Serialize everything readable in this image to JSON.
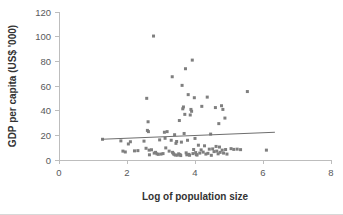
{
  "chart_data": {
    "type": "scatter",
    "title": "",
    "xlabel": "Log of population size",
    "ylabel": "GDP per capita (US$ '000)",
    "xlim": [
      0,
      8
    ],
    "ylim": [
      0,
      120
    ],
    "xticks": [
      0,
      2,
      4,
      6,
      8
    ],
    "yticks": [
      0,
      20,
      40,
      60,
      80,
      100,
      120
    ],
    "xtick_labels": [
      "0",
      "2",
      "4",
      "6",
      "8"
    ],
    "ytick_labels": [
      "0",
      "20",
      "40",
      "60",
      "80",
      "100",
      "120"
    ],
    "grid": false,
    "legend": null,
    "legend_position": "none",
    "series": [
      {
        "name": "Countries",
        "marker": "square",
        "color": "#7f7f7f",
        "points": [
          [
            1.28,
            16.8
          ],
          [
            1.82,
            15.5
          ],
          [
            1.88,
            7.2
          ],
          [
            1.95,
            6.5
          ],
          [
            2.04,
            13.0
          ],
          [
            2.1,
            14.8
          ],
          [
            2.22,
            7.4
          ],
          [
            2.32,
            7.6
          ],
          [
            2.5,
            15.3
          ],
          [
            2.56,
            9.5
          ],
          [
            2.58,
            50.0
          ],
          [
            2.6,
            24.0
          ],
          [
            2.62,
            31.0
          ],
          [
            2.63,
            23.0
          ],
          [
            2.65,
            8.0
          ],
          [
            2.66,
            4.2
          ],
          [
            2.72,
            8.3
          ],
          [
            2.78,
            100.5
          ],
          [
            2.8,
            5.6
          ],
          [
            2.84,
            6.2
          ],
          [
            2.88,
            5.0
          ],
          [
            2.92,
            4.6
          ],
          [
            2.96,
            16.3
          ],
          [
            3.0,
            4.8
          ],
          [
            3.06,
            5.2
          ],
          [
            3.1,
            22.5
          ],
          [
            3.12,
            17.6
          ],
          [
            3.14,
            9.8
          ],
          [
            3.18,
            23.0
          ],
          [
            3.24,
            7.2
          ],
          [
            3.3,
            16.0
          ],
          [
            3.33,
            67.5
          ],
          [
            3.34,
            6.2
          ],
          [
            3.36,
            5.4
          ],
          [
            3.38,
            4.6
          ],
          [
            3.4,
            20.5
          ],
          [
            3.42,
            4.0
          ],
          [
            3.44,
            13.5
          ],
          [
            3.46,
            15.0
          ],
          [
            3.48,
            3.9
          ],
          [
            3.52,
            5.0
          ],
          [
            3.54,
            32.0
          ],
          [
            3.56,
            4.4
          ],
          [
            3.58,
            3.6
          ],
          [
            3.6,
            14.5
          ],
          [
            3.62,
            60.5
          ],
          [
            3.64,
            41.5
          ],
          [
            3.66,
            43.0
          ],
          [
            3.68,
            21.5
          ],
          [
            3.7,
            37.0
          ],
          [
            3.72,
            74.0
          ],
          [
            3.74,
            5.8
          ],
          [
            3.76,
            4.2
          ],
          [
            3.78,
            16.0
          ],
          [
            3.8,
            53.0
          ],
          [
            3.82,
            4.6
          ],
          [
            3.84,
            3.8
          ],
          [
            3.86,
            36.5
          ],
          [
            3.88,
            41.0
          ],
          [
            3.9,
            39.5
          ],
          [
            3.92,
            81.0
          ],
          [
            3.94,
            5.2
          ],
          [
            3.96,
            8.5
          ],
          [
            3.98,
            50.5
          ],
          [
            4.0,
            17.5
          ],
          [
            4.02,
            6.0
          ],
          [
            4.04,
            4.4
          ],
          [
            4.06,
            4.0
          ],
          [
            4.1,
            12.0
          ],
          [
            4.14,
            5.6
          ],
          [
            4.18,
            8.2
          ],
          [
            4.2,
            43.5
          ],
          [
            4.24,
            6.4
          ],
          [
            4.28,
            11.5
          ],
          [
            4.32,
            4.8
          ],
          [
            4.36,
            51.0
          ],
          [
            4.38,
            5.4
          ],
          [
            4.42,
            8.8
          ],
          [
            4.46,
            21.0
          ],
          [
            4.48,
            3.8
          ],
          [
            4.52,
            9.0
          ],
          [
            4.56,
            6.8
          ],
          [
            4.6,
            42.5
          ],
          [
            4.62,
            11.0
          ],
          [
            4.64,
            7.2
          ],
          [
            4.68,
            5.0
          ],
          [
            4.7,
            29.5
          ],
          [
            4.72,
            10.5
          ],
          [
            4.74,
            6.2
          ],
          [
            4.78,
            44.0
          ],
          [
            4.8,
            8.0
          ],
          [
            4.82,
            41.0
          ],
          [
            4.84,
            5.6
          ],
          [
            4.88,
            34.0
          ],
          [
            4.9,
            8.5
          ],
          [
            4.94,
            4.8
          ],
          [
            5.06,
            9.2
          ],
          [
            5.14,
            8.6
          ],
          [
            5.24,
            8.8
          ],
          [
            5.34,
            8.4
          ],
          [
            5.54,
            55.5
          ],
          [
            6.1,
            8.0
          ]
        ]
      }
    ],
    "trendline": {
      "name": "linear-fit",
      "x_start": 1.25,
      "y_start": 16.8,
      "x_end": 6.35,
      "y_end": 22.5,
      "color": "#6e6e6e"
    }
  }
}
